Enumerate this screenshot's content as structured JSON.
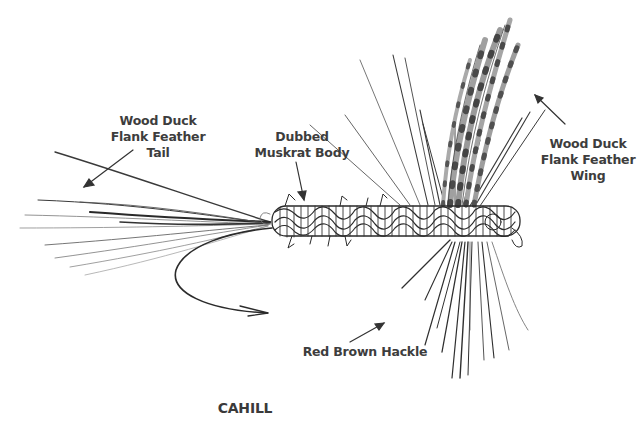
{
  "title": "CAHILL",
  "callouts": {
    "tail": {
      "lines": [
        "Wood Duck",
        "Flank Feather",
        "Tail"
      ]
    },
    "body": {
      "lines": [
        "Dubbed",
        "Muskrat Body"
      ]
    },
    "wing": {
      "lines": [
        "Wood Duck",
        "Flank Feather",
        "Wing"
      ]
    },
    "hackle": {
      "lines": [
        "Red Brown Hackle"
      ]
    }
  },
  "colors": {
    "background": "#ffffff",
    "ink": "#2b2b2b",
    "label": "#3d3d3d",
    "wing_fill": "#9a9a9a",
    "wing_bars": "#4a4a4a"
  }
}
